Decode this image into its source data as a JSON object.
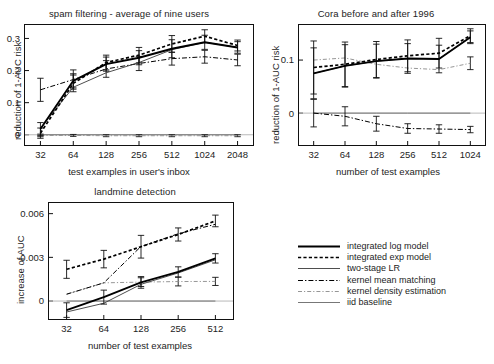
{
  "figure": {
    "panels": [
      "spam filtering - average of nine users",
      "Cora before and after 1996",
      "landmine detection"
    ]
  },
  "legend": {
    "position": "bottom-right",
    "entries": [
      {
        "label": "integrated log model",
        "style": "solid-thick",
        "color": "#000000"
      },
      {
        "label": "integrated exp model",
        "style": "dotted",
        "color": "#000000"
      },
      {
        "label": "two-stage LR",
        "style": "solid-thin",
        "color": "#333333"
      },
      {
        "label": "kernel mean matching",
        "style": "dash-dot",
        "color": "#000000"
      },
      {
        "label": "kernel density estimation",
        "style": "dash-dot-thin",
        "color": "#666666"
      },
      {
        "label": "iid baseline",
        "style": "solid-thin",
        "color": "#444444"
      }
    ]
  },
  "chart_data": [
    {
      "id": "spam-filtering",
      "type": "line",
      "title": "spam filtering - average of nine users",
      "xlabel": "test examples in user's inbox",
      "ylabel": "reduction of 1-AUC risk",
      "categories": [
        "32",
        "64",
        "128",
        "256",
        "512",
        "1024",
        "2048"
      ],
      "yticks": [
        0,
        0.1,
        0.2,
        0.3
      ],
      "ylim": [
        -0.035,
        0.345
      ],
      "grid": false,
      "errorbars": true,
      "series": [
        {
          "name": "integrated log model",
          "values": [
            0.018,
            0.168,
            0.22,
            0.24,
            0.268,
            0.288,
            0.272
          ],
          "err": [
            0.02,
            0.022,
            0.022,
            0.022,
            0.028,
            0.022,
            0.018
          ]
        },
        {
          "name": "integrated exp model",
          "values": [
            0.005,
            0.16,
            0.225,
            0.248,
            0.283,
            0.307,
            0.278
          ],
          "err": [
            0.016,
            0.026,
            0.023,
            0.024,
            0.026,
            0.02,
            0.017
          ]
        },
        {
          "name": "two-stage LR",
          "values": [
            0.02,
            0.148,
            0.193,
            0.225,
            0.265,
            0.288,
            0.272
          ],
          "err": [
            0.0,
            0.0,
            0.0,
            0.0,
            0.0,
            0.0,
            0.0
          ]
        },
        {
          "name": "kernel mean matching",
          "values": [
            0.14,
            0.172,
            0.205,
            0.222,
            0.237,
            0.243,
            0.233
          ],
          "err": [
            0.036,
            0.03,
            0.026,
            0.022,
            0.02,
            0.02,
            0.018
          ]
        },
        {
          "name": "kernel density estimation",
          "values": [
            -0.002,
            -0.002,
            -0.003,
            -0.003,
            -0.003,
            -0.003,
            -0.003
          ],
          "err": [
            0.004,
            0.003,
            0.003,
            0.003,
            0.003,
            0.003,
            0.003
          ]
        },
        {
          "name": "iid baseline",
          "values": [
            0.0,
            0.0,
            0.0,
            0.0,
            0.0,
            0.0,
            0.0
          ],
          "err": [
            0.0,
            0.0,
            0.0,
            0.0,
            0.0,
            0.0,
            0.0
          ]
        }
      ]
    },
    {
      "id": "cora",
      "type": "line",
      "title": "Cora before and after 1996",
      "xlabel": "number of test examples",
      "ylabel": "reduction of 1-AUC risk",
      "categories": [
        "32",
        "64",
        "128",
        "256",
        "512",
        "1024"
      ],
      "yticks": [
        0,
        0.1
      ],
      "ylim": [
        -0.062,
        0.168
      ],
      "grid": false,
      "errorbars": true,
      "series": [
        {
          "name": "integrated log model",
          "values": [
            0.075,
            0.089,
            0.098,
            0.103,
            0.102,
            0.143
          ],
          "err": [
            0.048,
            0.04,
            0.032,
            0.028,
            0.026,
            0.012
          ]
        },
        {
          "name": "integrated exp model",
          "values": [
            0.086,
            0.092,
            0.101,
            0.108,
            0.113,
            0.146
          ],
          "err": [
            0.05,
            0.042,
            0.034,
            0.03,
            0.028,
            0.013
          ]
        },
        {
          "name": "two-stage LR",
          "values": [
            0.075,
            0.089,
            0.098,
            0.103,
            0.102,
            0.143
          ],
          "err": [
            0.0,
            0.0,
            0.0,
            0.0,
            0.0,
            0.0
          ]
        },
        {
          "name": "kernel mean matching",
          "values": [
            0.0,
            -0.006,
            -0.02,
            -0.029,
            -0.03,
            -0.031
          ],
          "err": [
            0.026,
            0.018,
            0.014,
            0.009,
            0.008,
            0.006
          ]
        },
        {
          "name": "kernel density estimation",
          "values": [
            0.1,
            0.104,
            0.092,
            0.085,
            0.082,
            0.094
          ],
          "err": [
            0.0,
            0.0,
            0.0,
            0.0,
            0.0,
            0.012
          ]
        },
        {
          "name": "iid baseline",
          "values": [
            0.0,
            0.0,
            0.0,
            0.0,
            0.0,
            0.0
          ],
          "err": [
            0.0,
            0.0,
            0.0,
            0.0,
            0.0,
            0.0
          ]
        }
      ]
    },
    {
      "id": "landmine",
      "type": "line",
      "title": "landmine detection",
      "xlabel": "number of test examples",
      "ylabel": "increase of AUC",
      "categories": [
        "32",
        "64",
        "128",
        "256",
        "512"
      ],
      "yticks": [
        0,
        0.003,
        0.006
      ],
      "ylim": [
        -0.0013,
        0.0068
      ],
      "grid": false,
      "errorbars": true,
      "series": [
        {
          "name": "integrated log model",
          "values": [
            -0.00062,
            0.00027,
            0.00128,
            0.002,
            0.00293
          ],
          "err": [
            0.0005,
            0.00048,
            0.0004,
            0.00035,
            0.00032
          ]
        },
        {
          "name": "integrated exp model",
          "values": [
            0.00218,
            0.00288,
            0.00373,
            0.00457,
            0.0055
          ],
          "err": [
            0.00062,
            0.0006,
            0.00078,
            0.00045,
            0.0004
          ]
        },
        {
          "name": "two-stage LR",
          "values": [
            -0.00075,
            -0.00015,
            0.00115,
            0.00193,
            0.00283
          ],
          "err": [
            0.0,
            0.0,
            0.0,
            0.0,
            0.0
          ]
        },
        {
          "name": "kernel mean matching",
          "values": [
            0.00047,
            0.00125,
            0.00375,
            0.00462,
            0.00527
          ],
          "err": [
            0.0,
            0.0,
            0.0,
            0.0,
            0.0
          ]
        },
        {
          "name": "kernel density estimation",
          "values": [
            0.00047,
            0.00125,
            0.0013,
            0.00134,
            0.00135
          ],
          "err": [
            0.0,
            0.0,
            0.0003,
            0.0003,
            0.00028
          ]
        },
        {
          "name": "iid baseline",
          "values": [
            0.0,
            0.0,
            0.0,
            0.0,
            0.0
          ],
          "err": [
            0.0,
            0.0,
            0.0,
            0.0,
            0.0
          ]
        }
      ]
    }
  ]
}
